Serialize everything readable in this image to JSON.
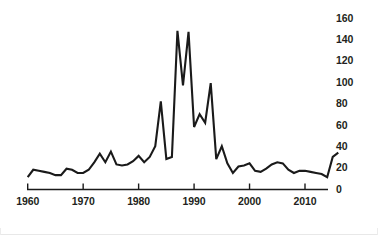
{
  "chart_data": {
    "type": "line",
    "title": "",
    "subtitle": "",
    "xlabel": "",
    "ylabel": "",
    "xlim": [
      1959,
      2017
    ],
    "ylim": [
      0,
      168
    ],
    "grid": false,
    "legend": null,
    "xticks": [
      1960,
      1970,
      1980,
      1990,
      2000,
      2010
    ],
    "xtick_labels": [
      "1960",
      "1970",
      "1980",
      "1990",
      "2000",
      "2010"
    ],
    "yticks": [
      0,
      20,
      40,
      60,
      80,
      100,
      120,
      140,
      160
    ],
    "ytick_labels": [
      "0",
      "20",
      "40",
      "60",
      "80",
      "100",
      "120",
      "140",
      "160"
    ],
    "line_color": "#1a1a1a",
    "axis_color": "#1a1a1a",
    "background_color": "#ffffff",
    "x": [
      1960,
      1961,
      1962,
      1963,
      1964,
      1965,
      1966,
      1967,
      1968,
      1969,
      1970,
      1971,
      1972,
      1973,
      1974,
      1975,
      1976,
      1977,
      1978,
      1979,
      1980,
      1981,
      1982,
      1983,
      1984,
      1985,
      1986,
      1987,
      1988,
      1989,
      1990,
      1991,
      1992,
      1993,
      1994,
      1995,
      1996,
      1997,
      1998,
      1999,
      2000,
      2001,
      2002,
      2003,
      2004,
      2005,
      2006,
      2007,
      2008,
      2009,
      2010,
      2011,
      2012,
      2013,
      2014,
      2015,
      2016
    ],
    "series": [
      {
        "name": "value",
        "values": [
          11,
          18,
          17,
          16,
          15,
          13,
          13,
          19,
          18,
          15,
          15,
          18,
          25,
          33,
          25,
          35,
          23,
          22,
          23,
          26,
          31,
          25,
          30,
          40,
          82,
          28,
          30,
          148,
          97,
          147,
          58,
          70,
          62,
          99,
          28,
          40,
          24,
          15,
          21,
          22,
          24,
          17,
          16,
          19,
          23,
          25,
          24,
          18,
          15,
          17,
          17,
          16,
          15,
          14,
          11,
          30,
          34
        ]
      }
    ]
  }
}
